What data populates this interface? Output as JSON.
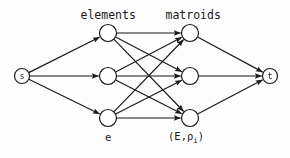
{
  "figure": {
    "title_left": "elements",
    "title_right": "matroids",
    "caption_left": "e",
    "caption_right_open": "(E,",
    "caption_right_rho": "ρ",
    "caption_right_sub": "i",
    "caption_right_close": ")",
    "source_label": "s",
    "sink_label": "t",
    "ink_color": "#1a1a1a",
    "background_color": "#fdfdfd"
  },
  "graph_data": {
    "type": "directed-bipartite-flow-network",
    "nodes": [
      {
        "id": "s",
        "label": "s",
        "x": 22,
        "y": 76,
        "r": 7.5,
        "kind": "source"
      },
      {
        "id": "e1",
        "label": "",
        "x": 108,
        "y": 33,
        "r": 8.5,
        "kind": "element"
      },
      {
        "id": "e2",
        "label": "",
        "x": 108,
        "y": 76,
        "r": 8.5,
        "kind": "element"
      },
      {
        "id": "e3",
        "label": "",
        "x": 108,
        "y": 118,
        "r": 8.5,
        "kind": "element"
      },
      {
        "id": "m1",
        "label": "",
        "x": 190,
        "y": 33,
        "r": 8.5,
        "kind": "matroid"
      },
      {
        "id": "m2",
        "label": "",
        "x": 190,
        "y": 76,
        "r": 8.5,
        "kind": "matroid"
      },
      {
        "id": "m3",
        "label": "",
        "x": 190,
        "y": 118,
        "r": 8.5,
        "kind": "matroid"
      },
      {
        "id": "t",
        "label": "t",
        "x": 270,
        "y": 76,
        "r": 7.5,
        "kind": "sink"
      }
    ],
    "edges": [
      {
        "from": "s",
        "to": "e1"
      },
      {
        "from": "s",
        "to": "e2"
      },
      {
        "from": "s",
        "to": "e3"
      },
      {
        "from": "e1",
        "to": "m1"
      },
      {
        "from": "e1",
        "to": "m2"
      },
      {
        "from": "e1",
        "to": "m3"
      },
      {
        "from": "e2",
        "to": "m1"
      },
      {
        "from": "e2",
        "to": "m2"
      },
      {
        "from": "e2",
        "to": "m3"
      },
      {
        "from": "e3",
        "to": "m1"
      },
      {
        "from": "e3",
        "to": "m2"
      },
      {
        "from": "e3",
        "to": "m3"
      },
      {
        "from": "m1",
        "to": "t"
      },
      {
        "from": "m2",
        "to": "t"
      },
      {
        "from": "m3",
        "to": "t"
      }
    ],
    "column_titles": [
      {
        "text": "elements",
        "x": 108,
        "y": 16
      },
      {
        "text": "matroids",
        "x": 193,
        "y": 16
      }
    ],
    "column_captions": [
      {
        "text": "e",
        "x": 108,
        "y": 137
      },
      {
        "text": "(E,ρi)",
        "x": 186,
        "y": 137
      }
    ]
  }
}
